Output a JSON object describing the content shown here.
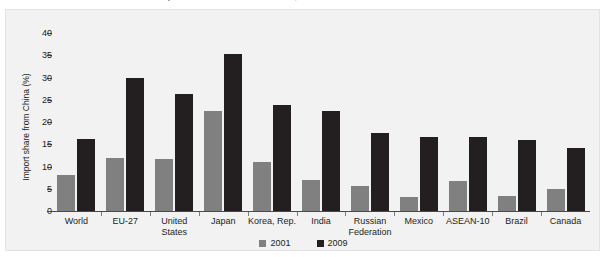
{
  "figure": {
    "caption": "FIGURE 1    Share of China in total imports of selected economies, 2001 and 2009",
    "background_color": "#f2f2f2",
    "page_background": "#ffffff"
  },
  "chart_data": {
    "type": "bar",
    "title": "",
    "xlabel": "",
    "ylabel": "Import share from China (%)",
    "ylim": [
      0,
      40
    ],
    "yticks": [
      0,
      5,
      10,
      15,
      20,
      25,
      30,
      35,
      40
    ],
    "ytick_labels": [
      "0",
      "5",
      "10",
      "15",
      "20",
      "25",
      "30",
      "35",
      "40"
    ],
    "grid": false,
    "legend_position": "bottom-center",
    "categories": [
      "World",
      "EU-27",
      "United States",
      "Japan",
      "Korea, Rep.",
      "India",
      "Russian Federation",
      "Mexico",
      "ASEAN-10",
      "Brazil",
      "Canada"
    ],
    "series": [
      {
        "name": "2001",
        "color": "#808080",
        "values": [
          8.2,
          12.0,
          11.7,
          22.5,
          11.1,
          7.0,
          5.6,
          3.1,
          6.8,
          3.4,
          4.9
        ]
      },
      {
        "name": "2009",
        "color": "#231f20",
        "values": [
          16.2,
          29.8,
          26.3,
          35.2,
          23.9,
          22.5,
          17.5,
          16.7,
          16.6,
          16.0,
          14.1
        ]
      }
    ]
  },
  "legend": {
    "items": [
      {
        "label": "2001",
        "color": "#808080"
      },
      {
        "label": "2009",
        "color": "#231f20"
      }
    ]
  }
}
